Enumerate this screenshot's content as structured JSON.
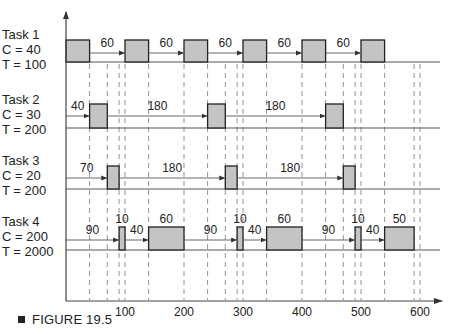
{
  "figure": {
    "caption": "FIGURE 19.5"
  },
  "tasks": [
    {
      "name": "Task 1",
      "c": "C = 40",
      "t": "T = 100"
    },
    {
      "name": "Task 2",
      "c": "C = 30",
      "t": "T = 200"
    },
    {
      "name": "Task 3",
      "c": "C = 20",
      "t": "T = 200"
    },
    {
      "name": "Task 4",
      "c": "C = 200",
      "t": "T = 2000"
    }
  ],
  "axis": {
    "ticks": [
      "100",
      "200",
      "300",
      "400",
      "500",
      "600"
    ]
  },
  "chart_data": {
    "type": "timeline",
    "title": "FIGURE 19.5",
    "xlabel": "time",
    "xlim": [
      0,
      600
    ],
    "xticks": [
      100,
      200,
      300,
      400,
      500,
      600
    ],
    "dashed_gridlines_at": [
      40,
      70,
      90,
      100,
      140,
      200,
      240,
      270,
      290,
      300,
      340,
      400,
      440,
      470,
      490,
      500,
      540,
      590,
      600
    ],
    "tasks": [
      {
        "name": "Task 1",
        "C": 40,
        "T": 100,
        "executions": [
          [
            0,
            40
          ],
          [
            100,
            140
          ],
          [
            200,
            240
          ],
          [
            300,
            340
          ],
          [
            400,
            440
          ],
          [
            500,
            540
          ]
        ],
        "gap_labels": [
          "60",
          "60",
          "60",
          "60",
          "60"
        ]
      },
      {
        "name": "Task 2",
        "C": 30,
        "T": 200,
        "executions": [
          [
            40,
            70
          ],
          [
            240,
            270
          ],
          [
            440,
            470
          ]
        ],
        "gap_labels": [
          "40",
          "180",
          "180"
        ]
      },
      {
        "name": "Task 3",
        "C": 20,
        "T": 200,
        "executions": [
          [
            70,
            90
          ],
          [
            270,
            290
          ],
          [
            470,
            490
          ]
        ],
        "gap_labels": [
          "70",
          "180",
          "180"
        ]
      },
      {
        "name": "Task 4",
        "C": 200,
        "T": 2000,
        "executions": [
          [
            90,
            100
          ],
          [
            140,
            200
          ],
          [
            290,
            300
          ],
          [
            340,
            400
          ],
          [
            490,
            500
          ],
          [
            540,
            590
          ]
        ],
        "block_labels": [
          "10",
          "60",
          "10",
          "60",
          "10",
          "50"
        ],
        "gap_labels": [
          "90",
          "40",
          "90",
          "40",
          "90",
          "40"
        ]
      }
    ]
  }
}
